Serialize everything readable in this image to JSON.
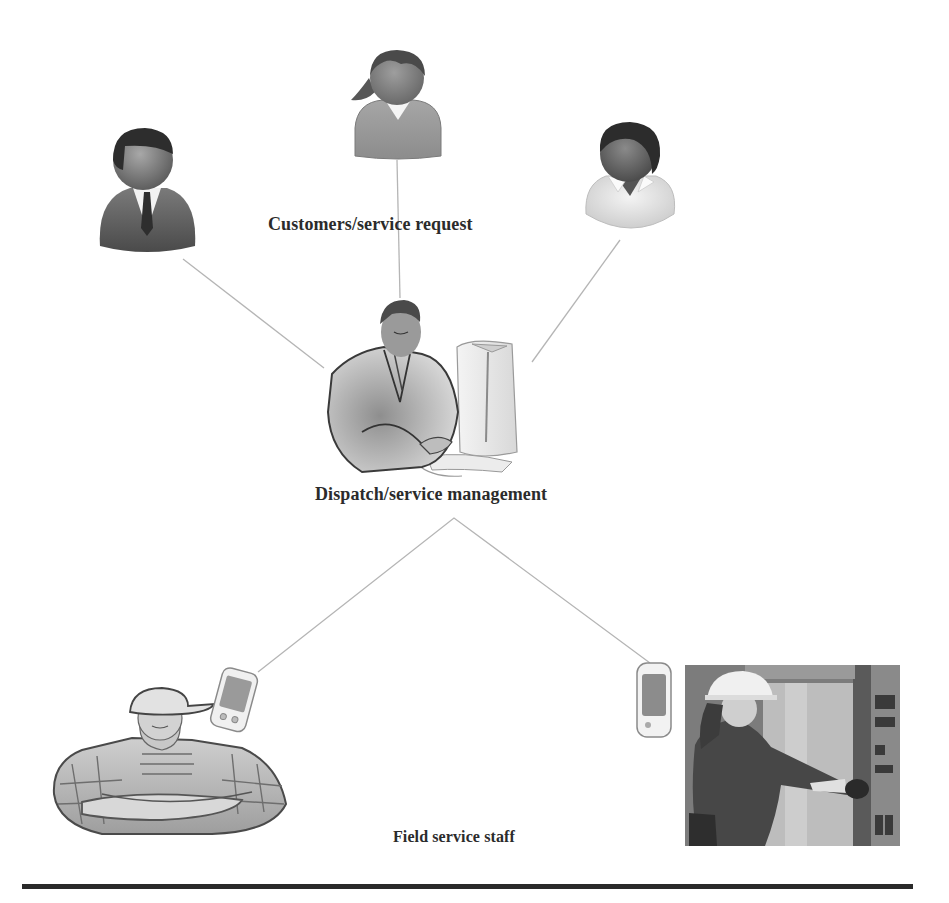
{
  "diagram": {
    "type": "hub-and-spoke flow diagram",
    "nodes": {
      "customers": {
        "label": "Customers/service request",
        "figures": [
          {
            "name": "customer-man-suit",
            "icon": "person-icon"
          },
          {
            "name": "customer-woman",
            "icon": "person-icon"
          },
          {
            "name": "customer-person-collar",
            "icon": "person-icon"
          }
        ]
      },
      "dispatch": {
        "label": "Dispatch/service management",
        "figure": {
          "name": "dispatcher-at-computer",
          "icon": "computer-operator-icon"
        }
      },
      "field": {
        "label": "Field service staff",
        "figures": [
          {
            "name": "worker-crossed-arms",
            "icon": "worker-icon",
            "device": "pda-icon"
          },
          {
            "name": "technician-hardhat-photo",
            "icon": "technician-icon",
            "device": "pda-icon"
          }
        ]
      }
    },
    "edges": [
      {
        "from": "customer-man-suit",
        "to": "dispatcher-at-computer"
      },
      {
        "from": "customer-woman",
        "to": "dispatcher-at-computer"
      },
      {
        "from": "customer-person-collar",
        "to": "dispatcher-at-computer"
      },
      {
        "from": "dispatcher-at-computer",
        "to": "worker-crossed-arms"
      },
      {
        "from": "dispatcher-at-computer",
        "to": "technician-hardhat-photo"
      }
    ],
    "colors": {
      "background": "#ffffff",
      "label_text": "#2b2b2b",
      "connector_line": "#b5b5b5",
      "rule": "#2a2a2a"
    }
  }
}
